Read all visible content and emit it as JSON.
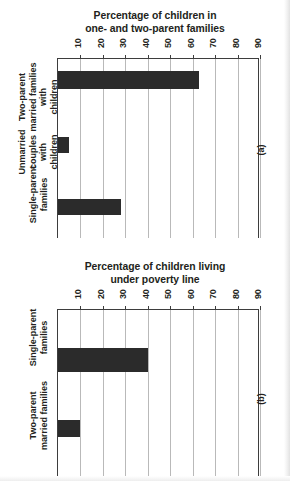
{
  "figure": {
    "orientation": "rotated-90",
    "bar_color": "#2b2b2b",
    "axis_color": "#3d3d3d",
    "grid_color": "#b9b9b9"
  },
  "panels": [
    {
      "marker": "(a)",
      "title_line1": "Percentage of children in",
      "title_line2": "one- and two-parent families"
    },
    {
      "marker": "(b)",
      "title_line1": "Percentage of children living",
      "title_line2": "under poverty line"
    }
  ],
  "chart_data": [
    {
      "type": "bar",
      "orientation": "horizontal",
      "title": "Percentage of children in one- and two-parent families",
      "panel": "(a)",
      "categories": [
        "Two-parent\nmarried families\nwith\nchildren",
        "Unmarried\ncouples\nwith\nchildren",
        "Single-parent\nfamilies"
      ],
      "values": [
        63,
        5,
        28
      ],
      "xlabel": "",
      "ylabel": "",
      "xlim": [
        0,
        90
      ],
      "ticks": [
        10,
        20,
        30,
        40,
        50,
        60,
        70,
        80,
        90
      ],
      "grid": true,
      "legend": "none"
    },
    {
      "type": "bar",
      "orientation": "horizontal",
      "title": "Percentage of children living under poverty line",
      "panel": "(b)",
      "categories": [
        "Single-parent\nfamilies",
        "Two-parent\nmarried families"
      ],
      "values": [
        40,
        10
      ],
      "xlabel": "",
      "ylabel": "",
      "xlim": [
        0,
        90
      ],
      "ticks": [
        10,
        20,
        30,
        40,
        50,
        60,
        70,
        80,
        90
      ],
      "grid": true,
      "legend": "none"
    }
  ]
}
